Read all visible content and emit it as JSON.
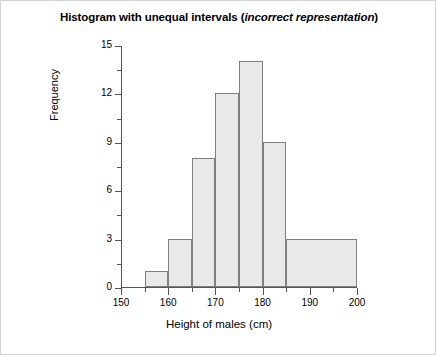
{
  "chart_data": {
    "type": "bar",
    "title": "Histogram with unequal intervals (incorrect representation)",
    "title_plain": "Histogram with unequal intervals ",
    "title_italic": "incorrect representation",
    "title_prefix": "Histogram with unequal intervals (",
    "title_suffix": ")",
    "xlabel": "Height of males (cm)",
    "ylabel": "Frequency",
    "xlim": [
      150,
      200
    ],
    "ylim": [
      0,
      15
    ],
    "grid": false,
    "legend": "none",
    "x_major_ticks": [
      150,
      160,
      170,
      180,
      190,
      200
    ],
    "x_minor_ticks": [
      155,
      165,
      175,
      185,
      195
    ],
    "y_major_ticks": [
      0,
      3,
      6,
      9,
      12,
      15
    ],
    "y_minor_ticks": [
      1.5,
      4.5,
      7.5,
      10.5,
      13.5
    ],
    "x_tick_labels": [
      "150",
      "160",
      "170",
      "180",
      "190",
      "200"
    ],
    "y_tick_labels": [
      "0",
      "3",
      "6",
      "9",
      "12",
      "15"
    ],
    "bar_fill_color": "#e9e9e9",
    "bar_edge_color": "#808080",
    "bins": [
      {
        "label": "155-160",
        "start": 155,
        "end": 160,
        "value": 1
      },
      {
        "label": "160-165",
        "start": 160,
        "end": 165,
        "value": 3
      },
      {
        "label": "165-170",
        "start": 165,
        "end": 170,
        "value": 8
      },
      {
        "label": "170-175",
        "start": 170,
        "end": 175,
        "value": 12
      },
      {
        "label": "175-180",
        "start": 175,
        "end": 180,
        "value": 14
      },
      {
        "label": "180-185",
        "start": 180,
        "end": 185,
        "value": 9
      },
      {
        "label": "185-200",
        "start": 185,
        "end": 200,
        "value": 3
      }
    ],
    "categories": [
      "155-160",
      "160-165",
      "165-170",
      "170-175",
      "175-180",
      "180-185",
      "185-200"
    ],
    "values": [
      1,
      3,
      8,
      12,
      14,
      9,
      3
    ]
  }
}
